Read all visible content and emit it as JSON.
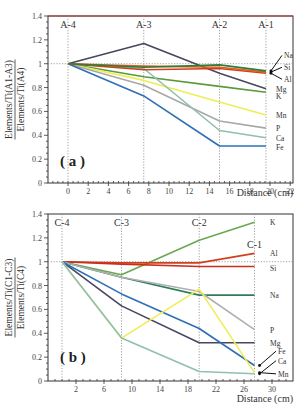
{
  "chart_data": [
    {
      "panel": "( a )",
      "type": "line",
      "title": "",
      "xlabel": "Distance (cm)",
      "ylabel_num": "Elements/Ti(A1-A3)",
      "ylabel_den": "Elements/Ti(A4)",
      "xlim": [
        -2.5,
        22
      ],
      "ylim": [
        0,
        1.4
      ],
      "xticks": [
        0,
        2,
        4,
        6,
        8,
        10,
        12,
        14,
        16,
        18,
        20,
        22
      ],
      "yticks": [
        0,
        0.2,
        0.4,
        0.6,
        0.8,
        1,
        1.2,
        1.4
      ],
      "ytick_labels": [
        "0",
        "0.2",
        "0.4",
        "0.6",
        "0.8",
        "1",
        "1.2",
        "1.4"
      ],
      "samples": [
        {
          "label": "A-4",
          "x": 0
        },
        {
          "label": "A-3",
          "x": 7.5
        },
        {
          "label": "A-2",
          "x": 15
        },
        {
          "label": "A-1",
          "x": 19.6
        }
      ],
      "reference_line": 1,
      "x": [
        0,
        7.5,
        15,
        19.6
      ],
      "series": [
        {
          "name": "Mg",
          "color": "#4a4560",
          "values": [
            1,
            1.17,
            0.92,
            0.79
          ]
        },
        {
          "name": "K",
          "color": "#5a9a3c",
          "values": [
            1,
            0.89,
            0.81,
            0.76
          ]
        },
        {
          "name": "Mn",
          "color": "#eeee55",
          "values": [
            1,
            0.86,
            0.68,
            0.57
          ]
        },
        {
          "name": "P",
          "color": "#a8a8a8",
          "values": [
            1,
            0.82,
            0.52,
            0.46
          ]
        },
        {
          "name": "Ca",
          "color": "#8fbfb0",
          "values": [
            1,
            0.96,
            0.44,
            0.38
          ]
        },
        {
          "name": "Fe",
          "color": "#2e6fb6",
          "values": [
            1,
            0.73,
            0.31,
            0.31
          ]
        },
        {
          "name": "Al",
          "color": "#d0401c",
          "values": [
            1,
            0.95,
            0.96,
            0.92
          ]
        },
        {
          "name": "Si",
          "color": "#e06020",
          "values": [
            1,
            0.98,
            0.97,
            0.93
          ]
        },
        {
          "name": "Na",
          "color": "#2e7d3a",
          "values": [
            1,
            0.97,
            0.99,
            0.94
          ]
        }
      ],
      "end_labels": [
        {
          "name": "Na",
          "y": 1.07,
          "arrow": true
        },
        {
          "name": "Si",
          "y": 0.97,
          "arrow": true
        },
        {
          "name": "Al",
          "y": 0.87,
          "arrow": true
        },
        {
          "name": "Mg",
          "y": 0.79
        },
        {
          "name": "K",
          "y": 0.73
        },
        {
          "name": "Mn",
          "y": 0.57
        },
        {
          "name": "P",
          "y": 0.46
        },
        {
          "name": "Ca",
          "y": 0.38
        },
        {
          "name": "Fe",
          "y": 0.3
        }
      ]
    },
    {
      "panel": "( b )",
      "type": "line",
      "title": "",
      "xlabel": "Distance (cm)",
      "ylabel_num": "Elements/Ti(C1-C3)",
      "ylabel_den": "Elements/Ti(C4)",
      "xlim": [
        -2,
        32
      ],
      "ylim": [
        0,
        1.4
      ],
      "xticks": [
        2,
        6,
        10,
        14,
        18,
        22,
        26,
        30
      ],
      "yticks": [
        0,
        0.2,
        0.4,
        0.6,
        0.8,
        1,
        1.2,
        1.4
      ],
      "ytick_labels": [
        "0",
        "0.2",
        "0.4",
        "0.6",
        "0.8",
        "1",
        "1.2",
        "1.4"
      ],
      "samples": [
        {
          "label": "C-4",
          "x": 0
        },
        {
          "label": "C-3",
          "x": 8.5
        },
        {
          "label": "C-2",
          "x": 19.6
        },
        {
          "label": "C-1",
          "x": 27.5
        }
      ],
      "reference_line": 1,
      "x": [
        0,
        8.5,
        19.6,
        27.5
      ],
      "series": [
        {
          "name": "K",
          "color": "#6aa84f",
          "values": [
            1,
            0.89,
            1.18,
            1.33
          ]
        },
        {
          "name": "Al",
          "color": "#d0401c",
          "values": [
            1,
            0.99,
            0.99,
            1.07
          ]
        },
        {
          "name": "Si",
          "color": "#c8301c",
          "values": [
            1,
            0.98,
            0.96,
            0.96
          ]
        },
        {
          "name": "Na",
          "color": "#2e7d5a",
          "values": [
            1,
            0.87,
            0.72,
            0.72
          ]
        },
        {
          "name": "P",
          "color": "#b0b0b0",
          "values": [
            1,
            0.87,
            0.75,
            0.43
          ]
        },
        {
          "name": "Mg",
          "color": "#4a4560",
          "values": [
            1,
            0.63,
            0.32,
            0.32
          ]
        },
        {
          "name": "Fe",
          "color": "#2e6fb6",
          "values": [
            1,
            0.73,
            0.44,
            0.13
          ]
        },
        {
          "name": "Mn",
          "color": "#eeee55",
          "values": [
            1,
            0.36,
            0.77,
            0.07
          ]
        },
        {
          "name": "Ca",
          "color": "#8fbfb0",
          "values": [
            1,
            0.36,
            0.08,
            0.06
          ]
        }
      ],
      "end_labels": [
        {
          "name": "K",
          "y": 1.33
        },
        {
          "name": "Al",
          "y": 1.07
        },
        {
          "name": "Si",
          "y": 0.95
        },
        {
          "name": "Na",
          "y": 0.72
        },
        {
          "name": "P",
          "y": 0.43
        },
        {
          "name": "Mg",
          "y": 0.32
        },
        {
          "name": "Fe",
          "y": 0.25,
          "arrow": true
        },
        {
          "name": "Ca",
          "y": 0.17,
          "arrow": true
        },
        {
          "name": "Mn",
          "y": 0.06,
          "arrow": true
        }
      ]
    }
  ]
}
